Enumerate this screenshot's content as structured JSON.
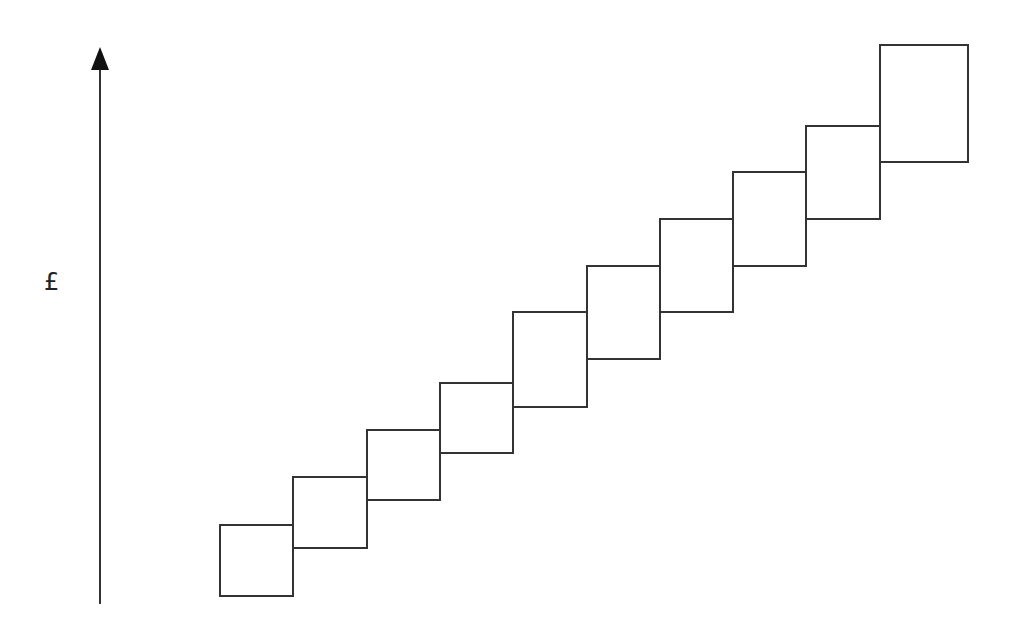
{
  "diagram": {
    "type": "stepped cost diagram",
    "y_axis_label": "£",
    "x_axis_label": "",
    "stroke_color": "#333333",
    "axis": {
      "x": 100,
      "y_top": 47,
      "y_bottom": 604
    },
    "boxes": [
      {
        "x": 220,
        "y": 525,
        "w": 73,
        "h": 71
      },
      {
        "x": 293,
        "y": 477,
        "w": 74,
        "h": 71
      },
      {
        "x": 367,
        "y": 430,
        "w": 73,
        "h": 70
      },
      {
        "x": 440,
        "y": 383,
        "w": 73,
        "h": 70
      },
      {
        "x": 513,
        "y": 312,
        "w": 74,
        "h": 95
      },
      {
        "x": 587,
        "y": 266,
        "w": 73,
        "h": 93
      },
      {
        "x": 660,
        "y": 219,
        "w": 73,
        "h": 93
      },
      {
        "x": 733,
        "y": 172,
        "w": 73,
        "h": 94
      },
      {
        "x": 806,
        "y": 126,
        "w": 74,
        "h": 93
      },
      {
        "x": 880,
        "y": 45,
        "w": 88,
        "h": 117
      }
    ]
  }
}
